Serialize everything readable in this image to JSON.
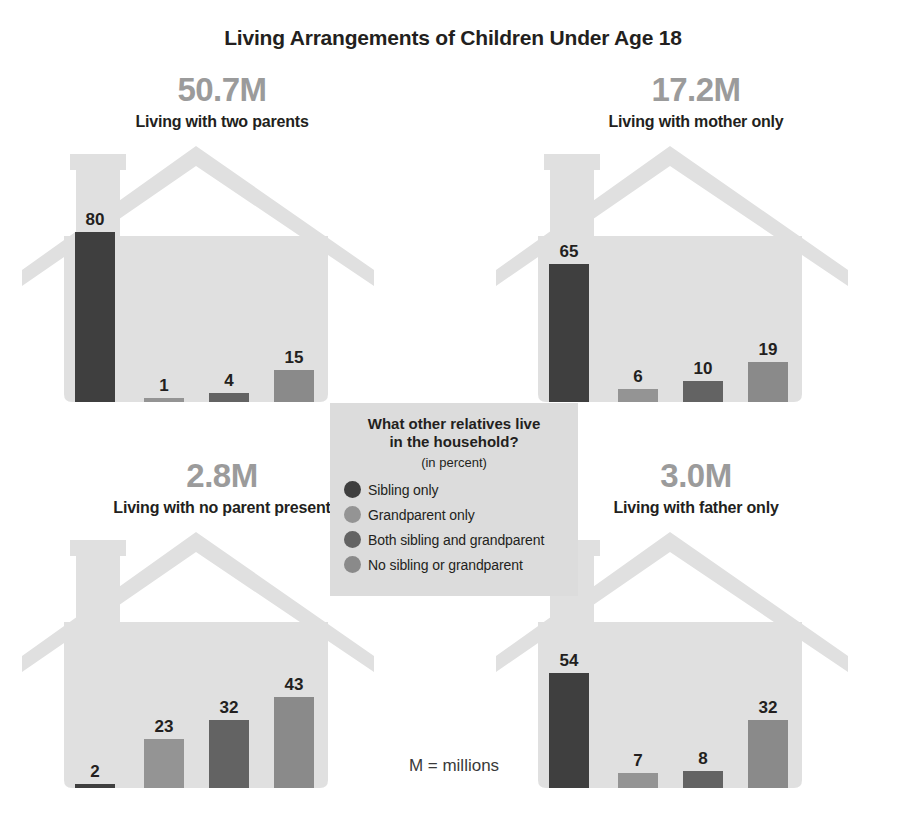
{
  "title": "Living Arrangements of Children Under Age 18",
  "footnote": "M = millions",
  "colors": {
    "house_fill": "#e0e0e0",
    "background": "#ffffff",
    "count_text": "#9b9b9b",
    "label_text": "#231f20",
    "legend_bg": "#dcdcdc",
    "sibling_only": "#3f3f3f",
    "grandparent_only": "#949494",
    "both_sibling_and_grandparent": "#636363",
    "no_sibling_or_grandparent": "#8a8a8a"
  },
  "legend": {
    "title_line1": "What other relatives live",
    "title_line2": "in the household?",
    "subtitle": "(in percent)",
    "items": [
      {
        "label": "Sibling only",
        "color": "#3f3f3f"
      },
      {
        "label": "Grandparent only",
        "color": "#949494"
      },
      {
        "label": "Both sibling and grandparent",
        "color": "#636363"
      },
      {
        "label": "No sibling or grandparent",
        "color": "#8a8a8a"
      }
    ]
  },
  "panels": [
    {
      "id": "two-parents",
      "count": "50.7M",
      "label": "Living with two parents",
      "values": [
        80,
        1,
        4,
        15
      ]
    },
    {
      "id": "mother-only",
      "count": "17.2M",
      "label": "Living with mother only",
      "values": [
        65,
        6,
        10,
        19
      ]
    },
    {
      "id": "no-parent-present",
      "count": "2.8M",
      "label": "Living with no parent present",
      "values": [
        2,
        23,
        32,
        43
      ]
    },
    {
      "id": "father-only",
      "count": "3.0M",
      "label": "Living with father only",
      "values": [
        54,
        7,
        8,
        32
      ]
    }
  ],
  "chart_data": {
    "type": "bar",
    "title": "Living Arrangements of Children Under Age 18",
    "subtitle": "What other relatives live in the household? (in percent)",
    "xlabel": "",
    "ylabel": "Percent",
    "ylim": [
      0,
      80
    ],
    "grid": false,
    "legend_position": "center",
    "note": "M = millions",
    "categories": [
      "Living with two parents (50.7M)",
      "Living with mother only (17.2M)",
      "Living with no parent present (2.8M)",
      "Living with father only (3.0M)"
    ],
    "series": [
      {
        "name": "Sibling only",
        "color": "#3f3f3f",
        "values": [
          80,
          65,
          2,
          54
        ]
      },
      {
        "name": "Grandparent only",
        "color": "#949494",
        "values": [
          1,
          6,
          23,
          7
        ]
      },
      {
        "name": "Both sibling and grandparent",
        "color": "#636363",
        "values": [
          4,
          10,
          32,
          8
        ]
      },
      {
        "name": "No sibling or grandparent",
        "color": "#8a8a8a",
        "values": [
          15,
          19,
          43,
          32
        ]
      }
    ],
    "group_totals": [
      {
        "group": "Living with two parents",
        "millions": 50.7
      },
      {
        "group": "Living with mother only",
        "millions": 17.2
      },
      {
        "group": "Living with no parent present",
        "millions": 2.8
      },
      {
        "group": "Living with father only",
        "millions": 3.0
      }
    ]
  }
}
